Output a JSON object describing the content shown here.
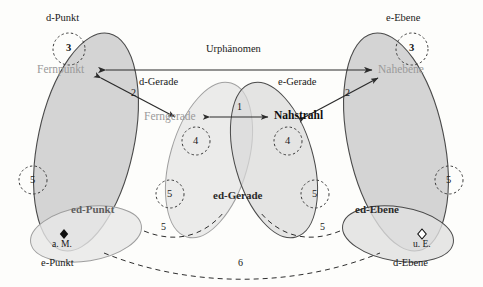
{
  "diagram": {
    "title_relation": "Urphänomen",
    "sets": {
      "d_punkt": "d-Punkt",
      "e_punkt": "e-Punkt",
      "d_gerade": "d-Gerade",
      "e_gerade": "e-Gerade",
      "d_ebene": "d-Ebene",
      "e_ebene": "e-Ebene"
    },
    "elements": {
      "fernpunkt": "Fernpunkt",
      "ferngerade": "Ferngerade",
      "nahstrahl": "Nahstrahl",
      "nahebene": "Nahebene",
      "ed_punkt": "ed-Punkt",
      "ed_gerade": "ed-Gerade",
      "ed_ebene": "ed-Ebene"
    },
    "points": {
      "a_m": "a. M.",
      "u_e": "u. E."
    },
    "relations": {
      "r1": "1",
      "r2_left": "2",
      "r2_right": "2",
      "r6": "6"
    },
    "markers": {
      "ring3_left": "3",
      "ring3_right": "3",
      "ring4_left": "4",
      "ring4_right": "4",
      "ring5_far_left": "5",
      "ring5_left_mid": "5",
      "ring5_right_mid": "5",
      "ring5_far_right": "5",
      "arc5_left": "5",
      "arc5_right": "5"
    },
    "colors": {
      "fill_dark": "#cfcfcf",
      "fill_mid": "#dcdcdc",
      "fill_light": "#e9e9e9",
      "stroke_dark": "#4a4a4a",
      "stroke_light": "#9e9e9e",
      "text_far": "#9a9a9a",
      "text_near": "#101010",
      "background": "#fdfdfb"
    }
  }
}
